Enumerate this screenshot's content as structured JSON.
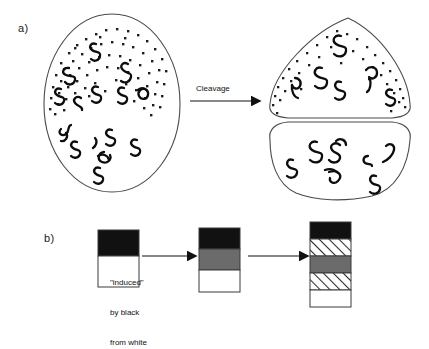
{
  "figure": {
    "panels": [
      {
        "id": "a",
        "label": "a)",
        "description": "Egg with pigmented animal pole cytoplasm cleaving into two cells",
        "arrow_label": "Cleavage",
        "left_cell": {
          "name": "uncleaved-egg",
          "regions": [
            {
              "name": "stippled-animal-pole",
              "fill": "stipple"
            },
            {
              "name": "clear-vegetal-pole",
              "fill": "white"
            }
          ],
          "organelle_count_top": 8,
          "organelle_count_bottom": 9
        },
        "right_cells": [
          {
            "name": "upper-blastomere",
            "fill": "stipple",
            "organelle_count": 6
          },
          {
            "name": "lower-blastomere",
            "fill": "white",
            "organelle_count": 7
          }
        ]
      },
      {
        "id": "b",
        "label": "b)",
        "description": "Two-band stack induced into three bands then five bands",
        "arrow_labels": [
          "\"induced\"\nby black\nfrom white",
          ""
        ],
        "induced_caption_lines": [
          "\"induced\"",
          "by black",
          "from white"
        ],
        "stacks": [
          {
            "name": "stack-initial",
            "bands": [
              {
                "name": "band-black",
                "fill": "black"
              },
              {
                "name": "band-white",
                "fill": "white"
              }
            ]
          },
          {
            "name": "stack-induced",
            "bands": [
              {
                "name": "band-black",
                "fill": "black"
              },
              {
                "name": "band-gray",
                "fill": "gray"
              },
              {
                "name": "band-white",
                "fill": "white"
              }
            ]
          },
          {
            "name": "stack-final",
            "bands": [
              {
                "name": "band-black",
                "fill": "black"
              },
              {
                "name": "band-hatched-upper",
                "fill": "hatch"
              },
              {
                "name": "band-gray",
                "fill": "gray"
              },
              {
                "name": "band-hatched-lower",
                "fill": "hatch"
              },
              {
                "name": "band-white",
                "fill": "white"
              }
            ]
          }
        ]
      }
    ]
  },
  "colors": {
    "black": "#111111",
    "gray": "#6b6b6b",
    "white": "#ffffff",
    "outline": "#3a3a3a",
    "ink": "#1a1a1a",
    "background": "#ffffff"
  }
}
